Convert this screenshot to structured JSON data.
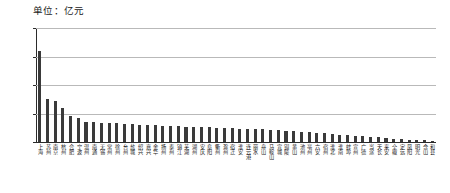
{
  "chart": {
    "unit_caption": "单位：亿元",
    "axis_color": "#2b2b2b",
    "grid_color": "#b9b9b9",
    "bar_color": "#3a3a3a"
  },
  "chart_data": {
    "type": "bar",
    "title": "",
    "subtitle": "",
    "xlabel": "",
    "ylabel": "单位：亿元",
    "ylim": [
      0,
      20000
    ],
    "yticks": [
      0,
      5000,
      10000,
      15000,
      20000
    ],
    "ytick_labels": [
      "0",
      "5000",
      "10000",
      "15000",
      "20000"
    ],
    "grid": true,
    "legend": null,
    "categories": [
      "上海",
      "苏州",
      "南京",
      "杭州",
      "合肥",
      "宁波",
      "温州",
      "南通",
      "无锡",
      "常州",
      "徐州",
      "台州",
      "盐城",
      "绍兴",
      "嘉兴",
      "金华",
      "扬州",
      "泰州",
      "镇江",
      "芜湖",
      "湖州",
      "安庆",
      "阜阳",
      "衢州",
      "滁州",
      "宿迁",
      "淮安",
      "连云港",
      "丽水",
      "舟山",
      "马鞍山",
      "宣城",
      "铜陵",
      "黄山",
      "池州",
      "亳州",
      "六安",
      "宿州",
      "淮北",
      "淮南",
      "蚌埠",
      "宣州",
      "广德",
      "当涂",
      "天长",
      "来安",
      "全椒",
      "定远",
      "凤阳",
      "明光",
      "含山",
      "和县"
    ],
    "values": [
      16000,
      7500,
      7200,
      6000,
      4500,
      4300,
      3500,
      3450,
      3400,
      3300,
      3250,
      3200,
      3100,
      3000,
      2950,
      2900,
      2850,
      2800,
      2750,
      2700,
      2650,
      2600,
      2550,
      2500,
      2450,
      2400,
      2350,
      2300,
      2250,
      2200,
      2150,
      2100,
      2000,
      1900,
      1800,
      1700,
      1600,
      1500,
      1400,
      1300,
      1200,
      1100,
      1000,
      900,
      800,
      700,
      600,
      500,
      420,
      350,
      280,
      220
    ]
  }
}
